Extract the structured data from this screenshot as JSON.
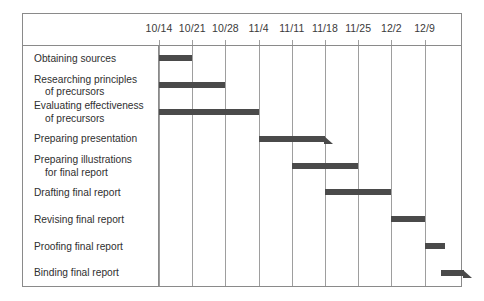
{
  "chart_data": {
    "type": "bar",
    "chart_kind": "gantt",
    "title": "",
    "xlabel": "",
    "ylabel": "",
    "grid": true,
    "legend": "none",
    "categories": [
      "Obtaining sources",
      "Researching principles of precursors",
      "Evaluating effectiveness of precursors",
      "Preparing presentation",
      "Preparing illustrations for final report",
      "Drafting final report",
      "Revising final report",
      "Proofing final report",
      "Binding final report"
    ],
    "x_tick_labels": [
      "10/14",
      "10/21",
      "10/28",
      "11/4",
      "11/11",
      "11/18",
      "11/25",
      "12/2",
      "12/9"
    ],
    "axis_unit": "week",
    "tasks": [
      {
        "name": "Obtaining sources",
        "label_line1": "Obtaining sources",
        "label_line2": "",
        "start_week": 0,
        "end_week": 1,
        "start_date": "10/14",
        "end_date": "10/21",
        "duration_weeks": 1,
        "milestone": false
      },
      {
        "name": "Researching principles of precursors",
        "label_line1": "Researching principles",
        "label_line2": "of precursors",
        "start_week": 0,
        "end_week": 2,
        "start_date": "10/14",
        "end_date": "10/28",
        "duration_weeks": 2,
        "milestone": false
      },
      {
        "name": "Evaluating effectiveness of precursors",
        "label_line1": "Evaluating effectiveness",
        "label_line2": "of precursors",
        "start_week": 0,
        "end_week": 3,
        "start_date": "10/14",
        "end_date": "11/4",
        "duration_weeks": 3,
        "milestone": false
      },
      {
        "name": "Preparing presentation",
        "label_line1": "Preparing presentation",
        "label_line2": "",
        "start_week": 3,
        "end_week": 5,
        "start_date": "11/4",
        "end_date": "11/18",
        "duration_weeks": 2,
        "milestone": true
      },
      {
        "name": "Preparing illustrations for final report",
        "label_line1": "Preparing illustrations",
        "label_line2": "for final report",
        "start_week": 4,
        "end_week": 6,
        "start_date": "11/11",
        "end_date": "11/25",
        "duration_weeks": 2,
        "milestone": false
      },
      {
        "name": "Drafting final report",
        "label_line1": "Drafting final report",
        "label_line2": "",
        "start_week": 5,
        "end_week": 7,
        "start_date": "11/18",
        "end_date": "12/2",
        "duration_weeks": 2,
        "milestone": false
      },
      {
        "name": "Revising final report",
        "label_line1": "Revising final report",
        "label_line2": "",
        "start_week": 7,
        "end_week": 8,
        "start_date": "12/2",
        "end_date": "12/9",
        "duration_weeks": 1,
        "milestone": false
      },
      {
        "name": "Proofing final report",
        "label_line1": "Proofing final report",
        "label_line2": "",
        "start_week": 8,
        "end_week": 8.6,
        "start_date": "12/9",
        "end_date": "12/13",
        "duration_weeks": 0.6,
        "milestone": false
      },
      {
        "name": "Binding final report",
        "label_line1": "Binding final report",
        "label_line2": "",
        "start_week": 8.5,
        "end_week": 9.2,
        "start_date": "12/12",
        "end_date": "12/16",
        "duration_weeks": 0.7,
        "milestone": true
      }
    ],
    "colors": {
      "bar": "#4a4a4a",
      "frame": "#8a8a8a",
      "gridline": "#9e9e9e",
      "text": "#2f2f2f",
      "background": "#ffffff"
    }
  }
}
